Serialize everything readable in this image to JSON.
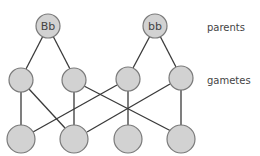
{
  "diagram": {
    "title": "",
    "row_labels": {
      "parents": "parents",
      "gametes": "gametes"
    },
    "parents": [
      {
        "id": "P1",
        "label": "Bb"
      },
      {
        "id": "P2",
        "label": "bb"
      }
    ],
    "gametes": [
      {
        "id": "G1",
        "label": ""
      },
      {
        "id": "G2",
        "label": ""
      },
      {
        "id": "G3",
        "label": ""
      },
      {
        "id": "G4",
        "label": ""
      }
    ],
    "offspring": [
      {
        "id": "O1",
        "label": ""
      },
      {
        "id": "O2",
        "label": ""
      },
      {
        "id": "O3",
        "label": ""
      },
      {
        "id": "O4",
        "label": ""
      }
    ],
    "edges": [
      [
        "P1",
        "G1"
      ],
      [
        "P1",
        "G2"
      ],
      [
        "P2",
        "G3"
      ],
      [
        "P2",
        "G4"
      ],
      [
        "G1",
        "O1"
      ],
      [
        "G1",
        "O2"
      ],
      [
        "G2",
        "O2"
      ],
      [
        "G2",
        "O4"
      ],
      [
        "G3",
        "O1"
      ],
      [
        "G3",
        "O3"
      ],
      [
        "G4",
        "O2"
      ],
      [
        "G4",
        "O4"
      ]
    ],
    "colors": {
      "node_fill": "#d2d2d2",
      "node_stroke": "#7a7a7a",
      "edge": "#3a3a3a",
      "text": "#444444"
    }
  }
}
